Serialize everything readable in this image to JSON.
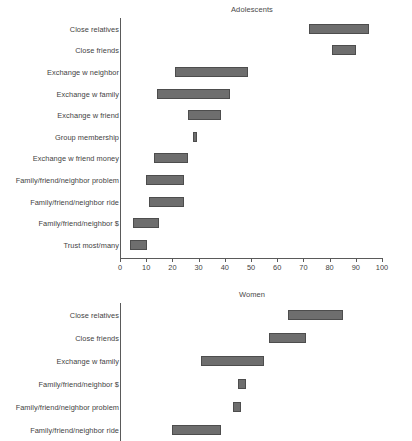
{
  "chart_data": [
    {
      "type": "bar",
      "title": "Adolescents",
      "xlabel": "",
      "ylabel": "",
      "xlim": [
        0,
        100
      ],
      "grid": false,
      "legend": false,
      "orientation": "horizontal",
      "bar_kind": "range",
      "xticks": [
        0,
        10,
        20,
        30,
        40,
        50,
        60,
        70,
        80,
        90,
        100
      ],
      "xtick_labels": [
        "0",
        "10",
        "20",
        "30",
        "40",
        "50",
        "60",
        "70",
        "80",
        "90",
        "100"
      ],
      "categories": [
        "Close relatives",
        "Close friends",
        "Exchange w neighbor",
        "Exchange w family",
        "Exchange w friend",
        "Group membership",
        "Exchange w friend money",
        "Family/friend/neighbor problem",
        "Family/friend/neighbor ride",
        "Family/friend/neighbor $",
        "Trust most/many"
      ],
      "ranges": [
        [
          72,
          95
        ],
        [
          81,
          90
        ],
        [
          21,
          49
        ],
        [
          14,
          42
        ],
        [
          26,
          38.5
        ],
        [
          28,
          29.5
        ],
        [
          13,
          26
        ],
        [
          10,
          24.5
        ],
        [
          11,
          24.5
        ],
        [
          5,
          15
        ],
        [
          4,
          10.5
        ]
      ]
    },
    {
      "type": "bar",
      "title": "Women",
      "xlabel": "",
      "ylabel": "",
      "xlim": [
        0,
        100
      ],
      "grid": false,
      "legend": false,
      "orientation": "horizontal",
      "bar_kind": "range",
      "xticks": [],
      "xtick_labels": [],
      "categories": [
        "Close relatives",
        "Close friends",
        "Exchange w family",
        "Family/friend/neighbor $",
        "Family/friend/neighbor problem",
        "Family/friend/neighbor ride"
      ],
      "ranges": [
        [
          64,
          85
        ],
        [
          57,
          71
        ],
        [
          31,
          55
        ],
        [
          45,
          48
        ],
        [
          43,
          46
        ],
        [
          20,
          38.5
        ]
      ]
    }
  ],
  "style": {
    "bar_fill": "#6e6e6e",
    "bar_edge": "#4d4d4d",
    "axis_color": "#5a5a5a",
    "text_color": "#3f3f3f",
    "background": "#ffffff"
  }
}
